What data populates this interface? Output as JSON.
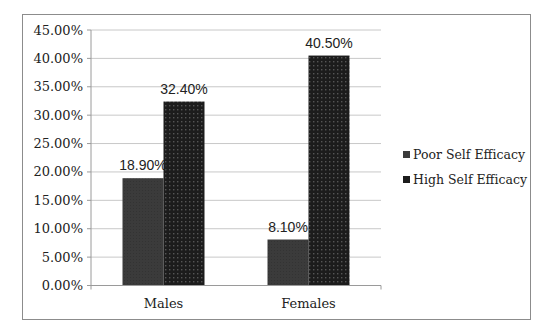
{
  "chart_data": {
    "type": "bar",
    "title": "",
    "xlabel": "",
    "ylabel": "",
    "categories": [
      "Males",
      "Females"
    ],
    "series": [
      {
        "name": "Poor Self Efficacy",
        "values": [
          18.9,
          8.1
        ],
        "labels": [
          "18.90%",
          "8.10%"
        ],
        "color": "#3b3b3b"
      },
      {
        "name": "High Self Efficacy",
        "values": [
          32.4,
          40.5
        ],
        "labels": [
          "32.40%",
          "40.50%"
        ],
        "color": "#1c1c1c"
      }
    ],
    "ylim": [
      0,
      45
    ],
    "yticks": [
      0,
      5,
      10,
      15,
      20,
      25,
      30,
      35,
      40,
      45
    ],
    "ytick_labels": [
      "0.00%",
      "5.00%",
      "10.00%",
      "15.00%",
      "20.00%",
      "25.00%",
      "30.00%",
      "35.00%",
      "40.00%",
      "45.00%"
    ],
    "grid": true,
    "legend_position": "right",
    "gridline_color": "#c8c8c8"
  }
}
